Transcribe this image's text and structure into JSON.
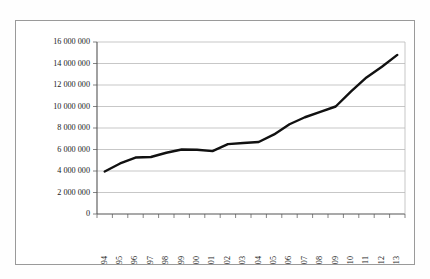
{
  "chart_data": {
    "type": "line",
    "title": "",
    "subtitle": "",
    "xlabel": "",
    "ylabel": "",
    "categories": [
      "1994",
      "1995",
      "1996",
      "1997",
      "1998",
      "1999",
      "2000",
      "2001",
      "2002",
      "2003",
      "2004",
      "2005",
      "2006",
      "2007",
      "2008",
      "2009",
      "2010",
      "2011",
      "2012",
      "2013"
    ],
    "series": [
      {
        "name": "",
        "values": [
          3950000,
          4700000,
          5250000,
          5300000,
          5700000,
          6000000,
          5980000,
          5850000,
          6500000,
          6600000,
          6700000,
          7400000,
          8350000,
          9000000,
          9500000,
          10000000,
          11400000,
          12700000,
          13700000,
          14800000
        ]
      }
    ],
    "ylim": [
      0,
      16000000
    ],
    "ytick_values": [
      0,
      2000000,
      4000000,
      6000000,
      8000000,
      10000000,
      12000000,
      14000000,
      16000000
    ],
    "ytick_labels": [
      "0",
      "2 000 000",
      "4 000 000",
      "6 000 000",
      "8 000 000",
      "10 000 000",
      "12 000 000",
      "14 000 000",
      "16 000 000"
    ],
    "grid": true,
    "grid_axis": "y",
    "legend": false,
    "legend_position": "none",
    "xtick_rotation": 90,
    "line_color": "#111111",
    "grid_color": "#b9b9b9",
    "axis_color": "#555555",
    "frame_color": "#9a9a9a",
    "background_color": "#ffffff",
    "annotations": []
  }
}
